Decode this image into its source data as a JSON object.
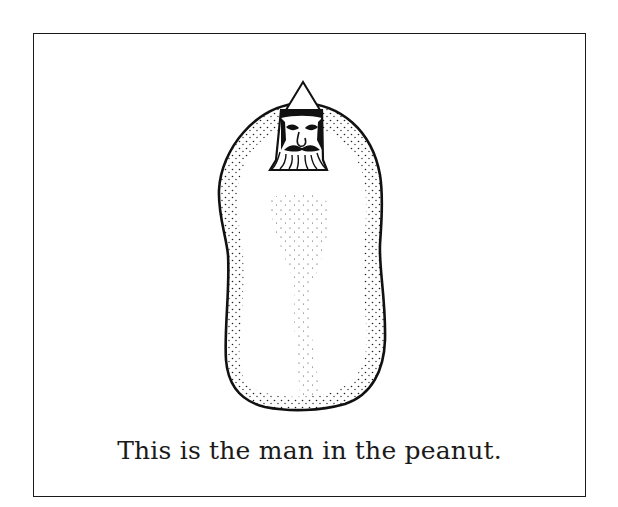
{
  "illustration": {
    "subject": "peanut-with-bearded-man-head",
    "stroke_color": "#111111",
    "background_color": "#ffffff"
  },
  "caption": {
    "text": "This is the man in the peanut."
  }
}
